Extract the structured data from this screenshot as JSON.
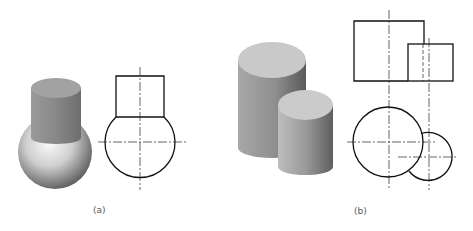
{
  "figure": {
    "panels": [
      {
        "id": "a",
        "label": "(a)",
        "description": "Cylinder on sphere: shaded 3D view and two-view orthographic outline",
        "solid": [
          "cylinder",
          "sphere"
        ]
      },
      {
        "id": "b",
        "label": "(b)",
        "description": "Two intersecting cylinders of different heights: shaded 3D view, front view and top view",
        "solid": [
          "large-cylinder",
          "small-cylinder"
        ]
      }
    ]
  },
  "colors": {
    "line": "#111111",
    "centerline": "#222222",
    "background": "#ffffff"
  }
}
